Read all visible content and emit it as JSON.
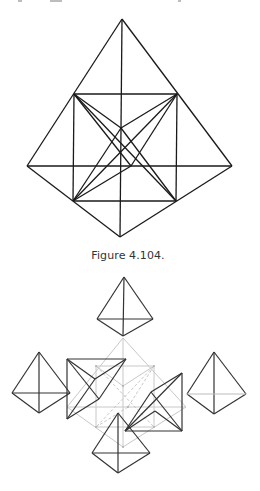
{
  "page": {
    "top_fragments": [
      {
        "x": 18,
        "w": 4
      },
      {
        "x": 50,
        "w": 12
      },
      {
        "x": 178,
        "w": 3
      }
    ]
  },
  "figure_top": {
    "caption": "Figure 4.104.",
    "stroke": "#1a1a1a",
    "points": {
      "apex": [
        122,
        19
      ],
      "left": [
        27,
        166
      ],
      "right": [
        232,
        166
      ],
      "bottom": [
        120,
        237
      ],
      "sq_tl": [
        74,
        94
      ],
      "sq_tr": [
        177,
        94
      ],
      "sq_bl": [
        73,
        201
      ],
      "sq_br": [
        176,
        201
      ],
      "inner": [
        121,
        128
      ],
      "cross": [
        131,
        166
      ]
    }
  },
  "figure_bottom": {
    "stroke_dark": "#333333",
    "stroke_light": "#c8c8c8",
    "tetra_top": {
      "apex": [
        124,
        277
      ],
      "left": [
        97,
        319
      ],
      "right": [
        153,
        319
      ],
      "bottom": [
        123,
        336
      ]
    },
    "tetra_left": {
      "apex": [
        39,
        352
      ],
      "left": [
        12,
        393
      ],
      "right": [
        70,
        393
      ],
      "bottom": [
        39,
        413
      ]
    },
    "tetra_right": {
      "apex": [
        214,
        352
      ],
      "left": [
        187,
        394
      ],
      "right": [
        246,
        394
      ],
      "bottom": [
        214,
        414
      ]
    },
    "tetra_bottom": {
      "apex": [
        118,
        413
      ],
      "left": [
        92,
        453
      ],
      "right": [
        150,
        453
      ],
      "bottom": [
        118,
        473
      ]
    },
    "tetra_center_left": {
      "tl": [
        67,
        359
      ],
      "tr": [
        126,
        359
      ],
      "bl": [
        67,
        419
      ],
      "p1": [
        95,
        379
      ],
      "p2": [
        99,
        399
      ]
    },
    "tetra_center_right": {
      "tr": [
        182,
        373
      ],
      "br": [
        182,
        431
      ],
      "bl": [
        125,
        431
      ],
      "p1": [
        151,
        392
      ],
      "p2": [
        155,
        411
      ]
    },
    "ghost": {
      "apex": [
        123,
        338
      ],
      "left": [
        67,
        407
      ],
      "right": [
        186,
        407
      ],
      "bottom": [
        123,
        447
      ],
      "sq_tl": [
        96,
        366
      ],
      "sq_tr": [
        154,
        366
      ],
      "sq_bl": [
        96,
        427
      ],
      "sq_br": [
        154,
        427
      ],
      "center": [
        123,
        386
      ],
      "cross": [
        128,
        407
      ]
    }
  }
}
